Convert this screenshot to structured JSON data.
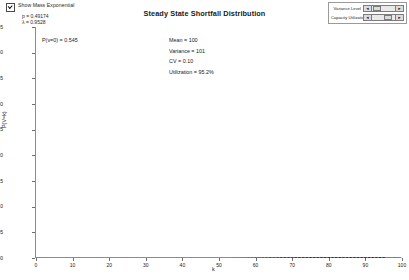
{
  "controls": {
    "checkbox": {
      "label": "Show Mass Exponential",
      "checked": true
    },
    "params": [
      {
        "text": "p = 0.49174"
      },
      {
        "text": "λ = 0.9528"
      }
    ],
    "sliders": [
      {
        "label": "Variance Level",
        "left_arrow": "◄",
        "right_arrow": "►",
        "thumb_pct": 4
      },
      {
        "label": "Capacity Utilization",
        "left_arrow": "◄",
        "right_arrow": "►",
        "thumb_pct": 52
      }
    ]
  },
  "chart_data": {
    "type": "scatter",
    "title": "Steady State Shortfall Distribution",
    "xlabel": "k",
    "ylabel": "P(V=k)",
    "xlim": [
      0,
      100
    ],
    "ylim": [
      0,
      0.045
    ],
    "grid": false,
    "legend": "none",
    "xticks": [
      0,
      10,
      20,
      30,
      40,
      50,
      60,
      70,
      80,
      90,
      100
    ],
    "yticks": [
      "0.000",
      "0.005",
      "0.010",
      "0.015",
      "0.020",
      "0.025",
      "0.030",
      "0.035",
      "0.040",
      "0.045"
    ],
    "ytick_values": [
      0.0,
      0.005,
      0.01,
      0.015,
      0.02,
      0.025,
      0.03,
      0.035,
      0.04,
      0.045
    ],
    "annotations": [
      {
        "name": "mass-at-zero",
        "text": "P(v=0) = 0.545"
      },
      {
        "name": "mean",
        "text": "Mean = 100"
      },
      {
        "name": "variance",
        "text": "Variance = 101"
      },
      {
        "name": "cv",
        "text": "CV = 0.10"
      },
      {
        "name": "utilization",
        "text": "Utilization = 95.2%"
      }
    ],
    "series": [
      {
        "name": "Shortfall probability mass",
        "style": "points",
        "color": "#1a1a1a",
        "x": [
          1,
          2,
          3,
          4,
          5,
          6,
          7,
          8,
          9,
          10,
          11,
          12,
          13,
          14,
          15,
          16,
          17,
          18,
          19,
          20,
          21,
          22,
          23,
          24,
          25,
          26,
          27,
          28,
          29,
          30,
          31,
          32,
          33,
          34,
          35,
          36,
          37,
          38,
          39,
          40,
          41,
          42,
          43,
          44,
          45,
          46,
          47,
          48,
          49,
          50,
          51,
          52,
          53,
          54,
          55,
          56,
          57,
          58,
          59,
          60,
          61,
          62,
          63,
          64,
          65,
          66,
          67,
          68,
          69,
          70,
          71,
          72,
          73,
          74,
          75,
          76,
          77,
          78,
          79,
          80,
          81,
          82,
          83,
          84,
          85,
          86,
          87,
          88,
          89,
          90,
          91,
          92,
          93,
          94,
          95
        ],
        "y": [
          0.0321,
          0.02862,
          0.02646,
          0.02452,
          0.02272,
          0.02106,
          0.01952,
          0.0181,
          0.01678,
          0.01555,
          0.01441,
          0.01336,
          0.01238,
          0.01148,
          0.01064,
          0.00986,
          0.00914,
          0.00847,
          0.00785,
          0.00728,
          0.00675,
          0.00626,
          0.0058,
          0.00538,
          0.00498,
          0.00462,
          0.00428,
          0.00397,
          0.00368,
          0.00341,
          0.00316,
          0.00293,
          0.00272,
          0.00252,
          0.00233,
          0.00216,
          0.002,
          0.00186,
          0.00172,
          0.0016,
          0.00148,
          0.00137,
          0.00127,
          0.00118,
          0.00109,
          0.00101,
          0.00094,
          0.00087,
          0.00081,
          0.00075,
          0.00069,
          0.00064,
          0.0006,
          0.00055,
          0.00051,
          0.00048,
          0.00044,
          0.00041,
          0.00038,
          0.00035,
          0.00033,
          0.0003,
          0.00028,
          0.00026,
          0.00024,
          0.00022,
          0.00021,
          0.00019,
          0.00018,
          0.00017,
          0.00015,
          0.00014,
          0.00013,
          0.00012,
          0.00011,
          0.00011,
          0.0001,
          9e-05,
          8e-05,
          8e-05,
          7e-05,
          7e-05,
          6e-05,
          6e-05,
          5e-05,
          5e-05,
          5e-05,
          4e-05,
          4e-05,
          4e-05,
          3e-05,
          3e-05,
          3e-05,
          3e-05,
          2e-05
        ]
      },
      {
        "name": "Mass exponential fit",
        "style": "line",
        "color": "#6e6e6e",
        "curve": {
          "form": "a*exp(-b*k)",
          "a": 0.047,
          "b": 0.097
        }
      }
    ]
  }
}
